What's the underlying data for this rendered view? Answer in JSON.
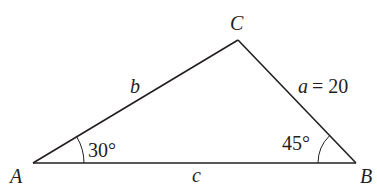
{
  "diagram": {
    "type": "triangle",
    "vertices": [
      {
        "name": "A",
        "x": 33,
        "y": 163
      },
      {
        "name": "B",
        "x": 356,
        "y": 163
      },
      {
        "name": "C",
        "x": 238,
        "y": 40
      }
    ],
    "vertex_labels": {
      "A": "A",
      "B": "B",
      "C": "C"
    },
    "side_labels": {
      "b": "b",
      "a_var": "a",
      "a_eq": "= 20",
      "c": "c"
    },
    "angle_labels": {
      "A": "30°",
      "B": "45°"
    },
    "colors": {
      "stroke": "#231f20",
      "background": "#ffffff"
    }
  }
}
